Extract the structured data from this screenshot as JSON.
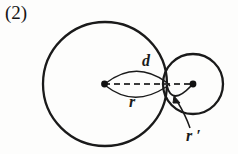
{
  "figure": {
    "item_number": "(2)",
    "labels": {
      "distance": "d",
      "radius_large": "r",
      "radius_small": "r ′"
    },
    "colors": {
      "stroke": "#1a1a1a",
      "background": "#fdfdfc",
      "dash": "#3a3a3a"
    },
    "geometry": {
      "large_circle": {
        "cx": 105,
        "cy": 84,
        "r": 62
      },
      "small_circle": {
        "cx": 193,
        "cy": 84,
        "r": 30
      },
      "tangent_point": {
        "x": 167,
        "y": 84
      },
      "center_dot_large": {
        "x": 105,
        "y": 84
      },
      "center_dot_small": {
        "x": 193,
        "y": 84
      },
      "dash_line": {
        "x1": 105,
        "y1": 84,
        "x2": 193,
        "y2": 84
      }
    }
  }
}
